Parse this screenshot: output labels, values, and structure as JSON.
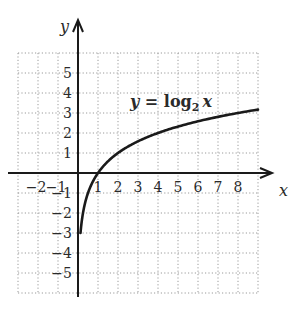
{
  "chart_data": {
    "type": "line",
    "title": "",
    "equation_label": {
      "lhs": "y",
      "eq": " = ",
      "fn": "log",
      "base": "2",
      "arg": "x"
    },
    "xlabel": "x",
    "ylabel": "y",
    "xlim": [
      -3,
      9.5
    ],
    "ylim": [
      -6,
      6
    ],
    "grid": true,
    "grid_style": "dotted",
    "x_tick_labels": [
      "-2",
      "-1",
      "1",
      "2",
      "3",
      "4",
      "5",
      "6",
      "7",
      "8"
    ],
    "x_ticks": [
      -2,
      -1,
      1,
      2,
      3,
      4,
      5,
      6,
      7,
      8
    ],
    "y_tick_labels": [
      "5",
      "4",
      "3",
      "2",
      "1",
      "-1",
      "-2",
      "-3",
      "-4",
      "-5"
    ],
    "y_ticks": [
      5,
      4,
      3,
      2,
      1,
      -1,
      -2,
      -3,
      -4,
      -5
    ],
    "series": [
      {
        "name": "y = log2 x",
        "x": [
          0.125,
          0.25,
          0.5,
          1,
          2,
          3,
          4,
          5,
          6,
          7,
          8,
          9
        ],
        "y": [
          -3,
          -2,
          -1,
          0,
          1,
          1.585,
          2,
          2.322,
          2.585,
          2.807,
          3,
          3.17
        ]
      }
    ],
    "colors": {
      "curve": "#1a1a1a",
      "axes": "#1a1a1a",
      "grid": "#9a9a9a"
    }
  }
}
